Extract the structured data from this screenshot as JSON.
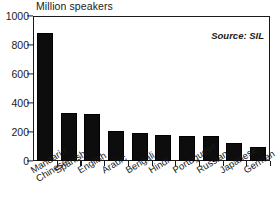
{
  "chart": {
    "title": "Million speakers",
    "source_note": "Source: SIL"
  },
  "chart_data": {
    "type": "bar",
    "title": "Million speakers",
    "xlabel": "",
    "ylabel": "Million speakers",
    "ylim": [
      0,
      1000
    ],
    "yticks": [
      0,
      200,
      400,
      600,
      800,
      1000
    ],
    "grid": false,
    "legend": false,
    "annotations": [
      "Source: SIL"
    ],
    "categories": [
      "Mandarin Chinese",
      "Spanish",
      "English",
      "Arabic",
      "Bengali",
      "Hindi",
      "Portuguese",
      "Russian",
      "Japanese",
      "German"
    ],
    "category_lines": [
      [
        "Mandarin",
        "Chinese"
      ],
      [
        "Spanish",
        ""
      ],
      [
        "English",
        ""
      ],
      [
        "Arabic",
        ""
      ],
      [
        "Bengali",
        ""
      ],
      [
        "Hindi",
        ""
      ],
      [
        "Portuguese",
        ""
      ],
      [
        "Russian",
        ""
      ],
      [
        "Japanese",
        ""
      ],
      [
        "German",
        ""
      ]
    ],
    "values": [
      885,
      332,
      322,
      205,
      190,
      182,
      170,
      170,
      125,
      98
    ],
    "bar_color": "#0d0d0d"
  }
}
